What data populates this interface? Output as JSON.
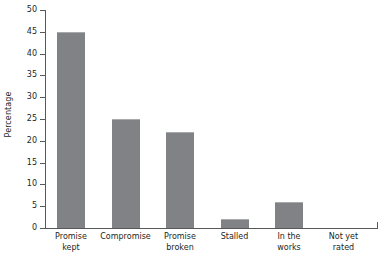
{
  "chart_data": {
    "type": "bar",
    "title": "",
    "subtitle": "",
    "xlabel": "",
    "ylabel": "Percentage",
    "ylim": [
      0,
      50
    ],
    "ytick_step": 5,
    "grid": false,
    "legend": false,
    "bar_color": "#808285",
    "axis_color": "#58595b",
    "categories": [
      "Promise kept",
      "Compromise",
      "Promise broken",
      "Stalled",
      "In the works",
      "Not yet rated"
    ],
    "category_lines": [
      [
        "Promise",
        "kept"
      ],
      [
        "Compromise",
        ""
      ],
      [
        "Promise",
        "broken"
      ],
      [
        "Stalled",
        ""
      ],
      [
        "In the",
        "works"
      ],
      [
        "Not yet",
        "rated"
      ]
    ],
    "values": [
      45,
      25,
      22,
      2,
      6,
      0
    ],
    "ytick_labels": [
      "0",
      "5",
      "10",
      "15",
      "20",
      "25",
      "30",
      "35",
      "40",
      "45",
      "50"
    ],
    "ytick_values": [
      0,
      5,
      10,
      15,
      20,
      25,
      30,
      35,
      40,
      45,
      50
    ]
  }
}
